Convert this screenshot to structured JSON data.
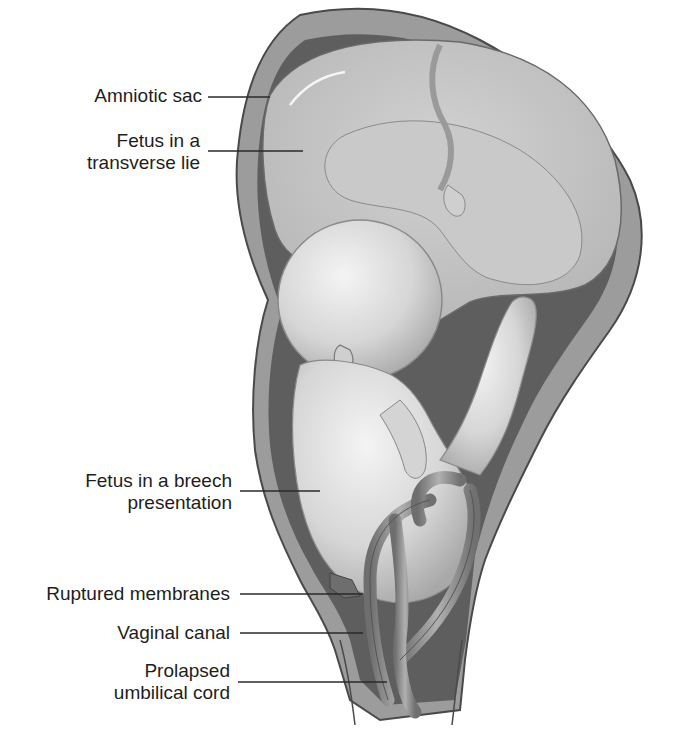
{
  "figure": {
    "labels": [
      {
        "id": "amniotic-sac",
        "lines": [
          "Amniotic sac"
        ]
      },
      {
        "id": "fetus-transverse",
        "lines": [
          "Fetus in a",
          "transverse lie"
        ]
      },
      {
        "id": "fetus-breech",
        "lines": [
          "Fetus in a breech",
          "presentation"
        ]
      },
      {
        "id": "ruptured-membranes",
        "lines": [
          "Ruptured membranes"
        ]
      },
      {
        "id": "vaginal-canal",
        "lines": [
          "Vaginal canal"
        ]
      },
      {
        "id": "prolapsed-cord",
        "lines": [
          "Prolapsed",
          "umbilical cord"
        ]
      }
    ]
  },
  "colors": {
    "background": "#ffffff",
    "text": "#1e1e1e",
    "uterine_wall": "#9a9a9a",
    "outline": "#555555",
    "amniotic_fluid": "#c4c4c4",
    "fetus_skin": "#dedede",
    "dark_cavity": "#5a5a5a",
    "cord": "#8a8a8a"
  }
}
